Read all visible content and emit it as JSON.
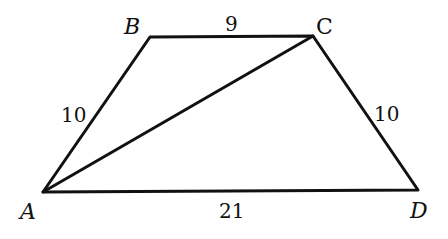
{
  "figure": {
    "type": "trapezoid",
    "vertices": {
      "A": {
        "label": "A",
        "x": 43,
        "y": 192
      },
      "B": {
        "label": "B",
        "x": 150,
        "y": 37
      },
      "C": {
        "label": "C",
        "x": 313,
        "y": 36
      },
      "D": {
        "label": "D",
        "x": 418,
        "y": 190
      }
    },
    "sides": {
      "AB": "10",
      "BC": "9",
      "CD": "10",
      "AD": "21"
    },
    "diagonal": "AC",
    "colors": {
      "stroke": "#111111",
      "background": "#ffffff"
    }
  }
}
